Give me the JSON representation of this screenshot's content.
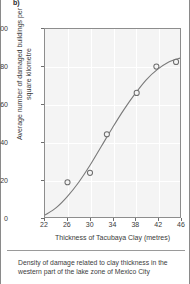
{
  "figure": {
    "panel_label": "b)",
    "caption": "Density of damage related to clay thickness in the western part of the lake zone of Mexico City"
  },
  "chart_data": {
    "type": "scatter",
    "title": "",
    "xlabel": "Thickness of Tacubaya Clay (metres)",
    "ylabel": "Average number of damaged buildings per square kilometre",
    "xlim": [
      22,
      46
    ],
    "ylim": [
      0,
      100
    ],
    "xticks": [
      22,
      26,
      30,
      34,
      38,
      42,
      46
    ],
    "xtick_labels": [
      "22",
      "26",
      "30",
      "34",
      "38",
      "42",
      "46"
    ],
    "yticks": [
      0,
      20,
      40,
      60,
      80,
      100
    ],
    "ytick_labels": [
      "0",
      "20",
      "40",
      "60",
      "80",
      "100"
    ],
    "grid": true,
    "legend": "none",
    "marker": "open-circle",
    "points": [
      {
        "x": 26.0,
        "y": 18.5
      },
      {
        "x": 30.0,
        "y": 23.5
      },
      {
        "x": 33.0,
        "y": 44.0
      },
      {
        "x": 38.3,
        "y": 66.0
      },
      {
        "x": 41.8,
        "y": 80.0
      },
      {
        "x": 45.3,
        "y": 82.5
      }
    ],
    "fit_curve": {
      "name": "trend",
      "x": [
        22.0,
        24.0,
        26.0,
        28.0,
        30.0,
        32.0,
        34.0,
        36.0,
        38.0,
        40.0,
        42.0,
        44.0,
        46.0
      ],
      "y": [
        1.0,
        5.0,
        11.0,
        18.5,
        27.5,
        37.5,
        47.5,
        57.0,
        65.5,
        73.0,
        78.5,
        82.5,
        84.5
      ]
    }
  },
  "colors": {
    "plot_background": "#f4f4f4",
    "gridline": "#ffffff",
    "axis": "#8d8d8d",
    "curve": "#7a7a7a",
    "marker_stroke": "#6e6e6e",
    "text": "#3a3a3a"
  }
}
